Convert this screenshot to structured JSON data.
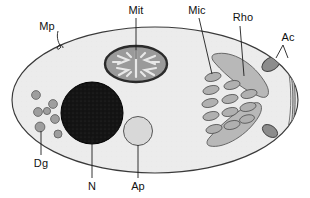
{
  "figure": {
    "type": "labelled-cell-diagram",
    "background_color": "#ffffff",
    "cell": {
      "name": "cell-body",
      "shape": "ellipse",
      "fill_color": "#ececec",
      "stroke_color": "#3a3a3a"
    }
  },
  "labels": {
    "mp": "Mp",
    "mit": "Mit",
    "mic": "Mic",
    "rho": "Rho",
    "ac": "Ac",
    "dg": "Dg",
    "n": "N",
    "ap": "Ap"
  },
  "organelles": {
    "mitochondrion": {
      "label_key": "mit",
      "fill_color": "#9a9a9a",
      "stroke_color": "#2b2b2b",
      "cristae_color": "#e8e8e8"
    },
    "nucleus": {
      "label_key": "n",
      "fill_color": "#141414",
      "stroke_color": "#000000"
    },
    "apicoplast": {
      "label_key": "ap",
      "fill_color": "#d8d8d8",
      "stroke_color": "#555555"
    },
    "dense_granules": {
      "label_key": "dg",
      "count": 7,
      "fill_color": "#9e9e9e",
      "stroke_color": "#5a5a5a"
    },
    "micronemes": {
      "label_key": "mic",
      "count": 12,
      "fill_color": "#b0b0b0",
      "stroke_color": "#5a5a5a"
    },
    "rhoptries": {
      "label_key": "rho",
      "count": 2,
      "fill_color": "#b8b8b8",
      "stroke_color": "#5a5a5a"
    },
    "apical_conoid": {
      "label_key": "ac",
      "count": 2,
      "fill_color": "#8c8c8c",
      "stroke_color": "#3d3d3d"
    },
    "apical_cap": {
      "fill_color": "#c6c6c6",
      "stroke_color": "#5a5a5a"
    },
    "membrane_pore": {
      "label_key": "mp"
    }
  }
}
